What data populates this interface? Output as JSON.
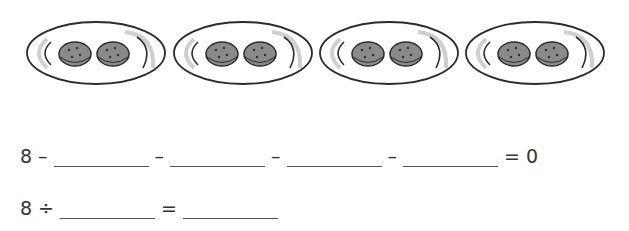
{
  "plates": [
    {
      "cookies": 2
    },
    {
      "cookies": 2
    },
    {
      "cookies": 2
    },
    {
      "cookies": 2
    }
  ],
  "colors": {
    "plate_outline": "#2b2b2b",
    "plate_shadow": "#cfcfcf",
    "cookie_fill": "#8a8a8a",
    "cookie_outline": "#2b2b2b",
    "text": "#333333"
  },
  "equation_subtraction": {
    "start": "8",
    "op": "–",
    "blanks": 4,
    "equals": "=",
    "result": "0"
  },
  "equation_division": {
    "start": "8",
    "op": "÷",
    "equals": "="
  }
}
